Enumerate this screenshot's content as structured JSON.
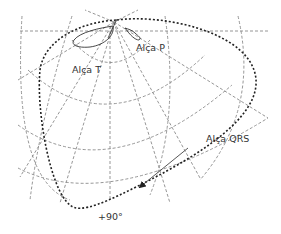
{
  "diagram": {
    "type": "vectorcardiogram-polar-grid",
    "labels": {
      "t_loop": "Alça T",
      "p_loop": "Alça P",
      "qrs_loop": "Alça QRS",
      "angle": "+90°"
    },
    "colors": {
      "grid": "#8a8a8a",
      "qrs_loop": "#222222",
      "loop_outline": "#333333",
      "arrow": "#444444",
      "text": "#333333",
      "background": "#ffffff"
    }
  }
}
